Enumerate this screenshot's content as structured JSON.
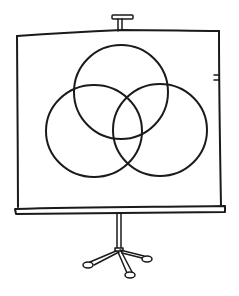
{
  "illustration": {
    "subject": "projector screen on tripod showing three-circle Venn diagram",
    "style": "hand-drawn line art",
    "colors": {
      "ink": "#1a1a1a",
      "background": "#ffffff"
    },
    "screen": {
      "top_left": [
        17,
        35
      ],
      "top_right": [
        219,
        31
      ],
      "bottom_y": 206
    },
    "venn": {
      "circles": [
        {
          "name": "top",
          "cx": 121,
          "cy": 92,
          "r": 47
        },
        {
          "name": "left",
          "cx": 94,
          "cy": 131,
          "r": 48
        },
        {
          "name": "right",
          "cx": 160,
          "cy": 130,
          "r": 47
        }
      ]
    },
    "stand": {
      "legs": 3,
      "feet": [
        [
          89,
          264
        ],
        [
          130,
          276
        ],
        [
          146,
          258
        ]
      ]
    }
  }
}
